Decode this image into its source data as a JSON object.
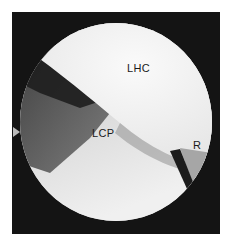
{
  "image": {
    "description": "Arthroscopic endoscopic view with anatomical labels",
    "labels": {
      "top": "LHC",
      "center": "LCP",
      "right": "R"
    },
    "colors": {
      "frame": "#141414",
      "bright_region": "#f2f2f2",
      "mid_region": "#cfcfcf",
      "dark_tissue": "#4a4a4a",
      "label_text": "#1a1a1a"
    }
  }
}
